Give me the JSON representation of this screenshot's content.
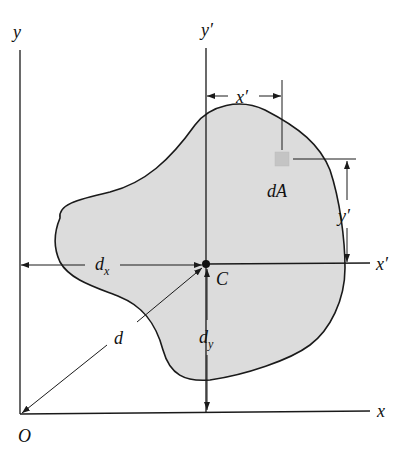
{
  "figure": {
    "colors": {
      "fill": "#dcdcdc",
      "stroke": "#1a1a1a",
      "element": "#c4c4c4"
    },
    "labels": {
      "y_axis": "y",
      "x_axis": "x",
      "origin": "O",
      "y_prime_axis": "y′",
      "x_prime_axis": "x′",
      "centroid": "C",
      "element": "dA",
      "x_prime_dim": "x′",
      "y_prime_dim": "y′",
      "dx_main": "d",
      "dx_sub": "x",
      "dy_main": "d",
      "dy_sub": "y",
      "d": "d"
    }
  }
}
